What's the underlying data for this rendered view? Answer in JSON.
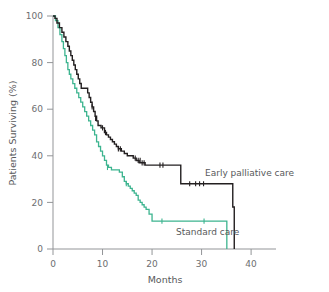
{
  "figure": {
    "type": "kaplan-meier-survival-plot",
    "background": "#ffffff"
  },
  "axes": {
    "x": {
      "label": "Months",
      "ticks": [
        0,
        10,
        20,
        30,
        40
      ],
      "tick_labels": [
        "0",
        "10",
        "20",
        "30",
        "40"
      ],
      "range": [
        0,
        42
      ],
      "pixel_range": [
        53,
        261
      ]
    },
    "y": {
      "label": "Patients Surviving (%)",
      "ticks": [
        0,
        20,
        40,
        60,
        80,
        100
      ],
      "tick_labels": [
        "0",
        "20",
        "40",
        "60",
        "80",
        "100"
      ],
      "range": [
        0,
        100
      ],
      "pixel_range": [
        249,
        16
      ]
    },
    "grid": false,
    "spine_color": "#939598",
    "text_color": "#58595b"
  },
  "legend": {
    "position": "inline-annotations",
    "entries": [
      {
        "name": "early-palliative-care",
        "label": "Early palliative care",
        "color": "#231f20",
        "label_x": 205,
        "label_y": 176
      },
      {
        "name": "standard-care",
        "label": "Standard care",
        "color": "#3cb48f",
        "label_x": 176,
        "label_y": 235
      }
    ]
  },
  "chart_data": {
    "type": "line",
    "title": "",
    "xlabel": "Months",
    "ylabel": "Patients Surviving (%)",
    "xlim": [
      0,
      42
    ],
    "ylim": [
      0,
      100
    ],
    "grid": false,
    "legend_position": "inline",
    "step_style": "post",
    "series": [
      {
        "name": "Early palliative care",
        "color": "#231f20",
        "x": [
          0,
          0.4,
          0.8,
          1.3,
          1.8,
          2.2,
          2.6,
          3.0,
          3.3,
          3.6,
          3.9,
          4.2,
          4.5,
          4.8,
          5.1,
          5.4,
          5.7,
          6.0,
          6.6,
          7.0,
          7.3,
          7.6,
          7.9,
          8.2,
          8.5,
          8.8,
          9.1,
          9.4,
          9.7,
          10.0,
          10.4,
          10.8,
          11.2,
          11.6,
          12.0,
          12.4,
          12.8,
          13.2,
          13.8,
          14.4,
          15.0,
          15.6,
          16.2,
          16.8,
          17.4,
          18.0,
          18.6,
          19.2,
          25.2,
          25.8,
          33.0,
          36.3,
          36.6
        ],
        "y": [
          100,
          99,
          97,
          95,
          93,
          91,
          89,
          87,
          85,
          83,
          81,
          79,
          77,
          75,
          73,
          71,
          69,
          69,
          69,
          67,
          65,
          63,
          61,
          59,
          57,
          55,
          53,
          53,
          52,
          52,
          50,
          49,
          48,
          47,
          46,
          45,
          44,
          43,
          42,
          41,
          40,
          40,
          39,
          38,
          37,
          37,
          36,
          36,
          36,
          28,
          28,
          18,
          0
        ],
        "censor_x": [
          7.9,
          8.6,
          10.0,
          10.6,
          13.2,
          13.6,
          16.6,
          17.2,
          17.6,
          18.0,
          18.4,
          21.6,
          22.2,
          27.6,
          28.8,
          29.6,
          30.4
        ],
        "censor_y": [
          61,
          56,
          52,
          50,
          43,
          43,
          39,
          38,
          38,
          37,
          37,
          36,
          36,
          28,
          28,
          28,
          28
        ]
      },
      {
        "name": "Standard care",
        "color": "#3cb48f",
        "x": [
          0,
          0.5,
          1.0,
          1.4,
          1.8,
          2.1,
          2.4,
          2.7,
          3.0,
          3.3,
          3.6,
          4.0,
          4.4,
          4.8,
          5.2,
          5.6,
          6.0,
          6.4,
          6.8,
          7.2,
          7.6,
          8.0,
          8.4,
          8.8,
          9.2,
          9.6,
          10.0,
          10.4,
          10.8,
          11.2,
          11.8,
          12.6,
          13.4,
          14.0,
          14.4,
          14.8,
          15.2,
          15.6,
          16.0,
          16.4,
          16.8,
          17.2,
          17.6,
          18.0,
          18.4,
          18.8,
          19.4,
          20.0,
          35.0,
          35.1
        ],
        "y": [
          100,
          98,
          95,
          92,
          89,
          86,
          83,
          80,
          77,
          75,
          73,
          71,
          69,
          67,
          65,
          63,
          61,
          59,
          57,
          55,
          53,
          51,
          49,
          46,
          44,
          42,
          40,
          38,
          36,
          35,
          34,
          34,
          33,
          31,
          29,
          28,
          27,
          26,
          25,
          24,
          23,
          21,
          20,
          19,
          18,
          17,
          15,
          12,
          12,
          0
        ],
        "censor_x": [
          11.0,
          14.8,
          22.0,
          30.5
        ],
        "censor_y": [
          35,
          28,
          12,
          12
        ]
      }
    ]
  }
}
